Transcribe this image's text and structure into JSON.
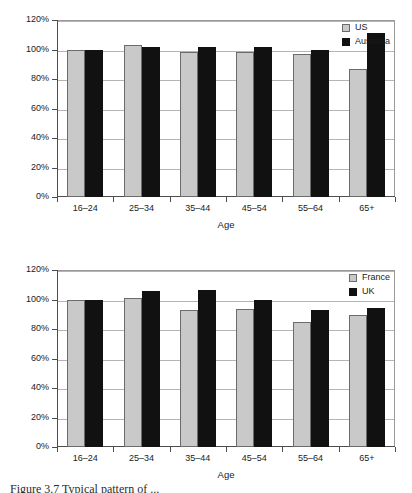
{
  "page": {
    "caption": "Figure 3.7  Typical pattern of ..."
  },
  "chart_data": [
    {
      "id": "chart-top",
      "type": "bar",
      "title": "",
      "xlabel": "Age",
      "ylabel": "",
      "categories": [
        "16–24",
        "25–34",
        "35–44",
        "45–54",
        "55–64",
        "65+"
      ],
      "ylim": [
        0,
        120
      ],
      "ytick_labels": [
        "0%",
        "20%",
        "40%",
        "60%",
        "80%",
        "100%",
        "120%"
      ],
      "ytick_values": [
        0,
        20,
        40,
        60,
        80,
        100,
        120
      ],
      "grid": true,
      "legend_position": "top-right",
      "series": [
        {
          "name": "US",
          "color": "#c9c9c9",
          "values": [
            100,
            103,
            98.5,
            98.5,
            97,
            86.5
          ]
        },
        {
          "name": "Australia",
          "color": "#111111",
          "values": [
            100,
            102,
            101.5,
            101.5,
            100,
            111
          ]
        }
      ]
    },
    {
      "id": "chart-bottom",
      "type": "bar",
      "title": "",
      "xlabel": "Age",
      "ylabel": "",
      "categories": [
        "16–24",
        "25–34",
        "35–44",
        "45–54",
        "55–64",
        "65+"
      ],
      "ylim": [
        0,
        120
      ],
      "ytick_labels": [
        "0%",
        "20%",
        "40%",
        "60%",
        "80%",
        "100%",
        "120%"
      ],
      "ytick_values": [
        0,
        20,
        40,
        60,
        80,
        100,
        120
      ],
      "grid": true,
      "legend_position": "top-right",
      "series": [
        {
          "name": "France",
          "color": "#c9c9c9",
          "values": [
            100,
            101,
            93,
            93.5,
            84.5,
            89.5
          ]
        },
        {
          "name": "UK",
          "color": "#111111",
          "values": [
            100,
            106,
            106.5,
            99.5,
            93,
            94
          ]
        }
      ]
    }
  ]
}
